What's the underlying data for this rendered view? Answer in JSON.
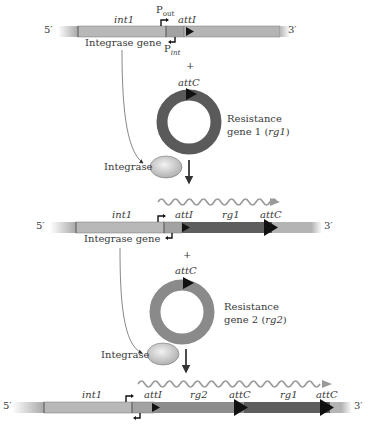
{
  "figure": {
    "stage1": {
      "five_prime": "5′",
      "three_prime": "3′",
      "int_label": "int1",
      "pout_label": "P",
      "pout_sub": "out",
      "pint_label": "P",
      "pint_sub": "int",
      "att_label": "attI",
      "gene_label": "Integrase gene"
    },
    "plus1": "+",
    "circle1": {
      "att_label": "attC",
      "name_line1": "Resistance",
      "name_line2_prefix": "gene 1 (",
      "name_line2_italic": "rg1",
      "name_line2_suffix": ")",
      "color": "#5a5a5a"
    },
    "integrase1": "Integrase",
    "stage2": {
      "five_prime": "5′",
      "three_prime": "3′",
      "int_label": "int1",
      "att_label": "attI",
      "rg_label": "rg1",
      "attc_label": "attC",
      "gene_label": "Integrase gene"
    },
    "plus2": "+",
    "circle2": {
      "att_label": "attC",
      "name_line1": "Resistance",
      "name_line2_prefix": "gene 2 (",
      "name_line2_italic": "rg2",
      "name_line2_suffix": ")",
      "color": "#8a8a8a"
    },
    "integrase2": "Integrase",
    "stage3": {
      "five_prime": "5′",
      "three_prime": "3′",
      "int_label": "int1",
      "att_label": "attI",
      "rg2_label": "rg2",
      "attc1_label": "attC",
      "rg1_label": "rg1",
      "attc2_label": "attC"
    },
    "colors": {
      "bar_light": "#b4b4b4",
      "bar_mid": "#a0a0a0",
      "rg1": "#5e5e5e",
      "rg2": "#8c8c8c",
      "transcript": "#9a9a9a"
    }
  }
}
